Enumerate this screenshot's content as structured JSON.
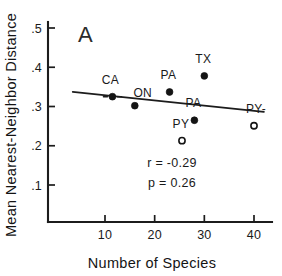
{
  "chart_data": {
    "type": "scatter",
    "title": "",
    "panel_label": "A",
    "xlabel": "Number of Species",
    "ylabel": "Mean Nearest-Neighbor Distance",
    "xlim": [
      2,
      43
    ],
    "ylim": [
      0.03,
      0.53
    ],
    "grid": false,
    "legend": "none",
    "xticks": [
      10,
      20,
      30,
      40
    ],
    "xtick_labels": [
      "10",
      "20",
      "30",
      "40"
    ],
    "yticks": [
      0.1,
      0.2,
      0.3,
      0.4,
      0.5
    ],
    "ytick_labels": [
      ".1",
      ".2",
      ".3",
      ".4",
      ".5"
    ],
    "points": [
      {
        "label": "CA",
        "x": 11.5,
        "y": 0.325,
        "marker": "filled",
        "label_dx": -2,
        "label_dy": -13,
        "leader": "left-dash"
      },
      {
        "label": "ON",
        "x": 16.0,
        "y": 0.302,
        "marker": "filled",
        "label_dx": 8,
        "label_dy": -9,
        "leader": "none"
      },
      {
        "label": "PA",
        "x": 23.0,
        "y": 0.337,
        "marker": "filled",
        "label_dx": -1,
        "label_dy": -13,
        "leader": "none"
      },
      {
        "label": "TX",
        "x": 30.0,
        "y": 0.378,
        "marker": "filled",
        "label_dx": -1,
        "label_dy": -13,
        "leader": "none"
      },
      {
        "label": "PA",
        "x": 28.0,
        "y": 0.265,
        "marker": "filled",
        "label_dx": -1,
        "label_dy": -13,
        "leader": "none"
      },
      {
        "label": "PY",
        "x": 25.5,
        "y": 0.213,
        "marker": "open",
        "label_dx": -1,
        "label_dy": -13,
        "leader": "none"
      },
      {
        "label": "PY-",
        "x": 40.0,
        "y": 0.251,
        "marker": "open",
        "label_dx": 2,
        "label_dy": -13,
        "leader": "right-dash"
      }
    ],
    "regression_line": {
      "x_start": 3.5,
      "y_start": 0.3375,
      "x_end": 42.0,
      "y_end": 0.2865
    },
    "annotations": {
      "r_text": "r = -0.29",
      "p_text": "p = 0.26",
      "r_value": -0.29,
      "p_value": 0.26
    },
    "colors": {
      "ink": "#1a1a1a",
      "background": "#ffffff"
    }
  }
}
